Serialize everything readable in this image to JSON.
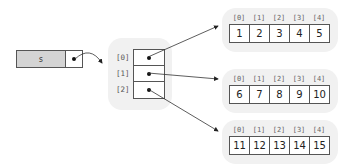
{
  "variable": {
    "name": "s"
  },
  "outer_array": {
    "indices": [
      "[0]",
      "[1]",
      "[2]"
    ]
  },
  "inner_arrays": [
    {
      "indices": [
        "[0]",
        "[1]",
        "[2]",
        "[3]",
        "[4]"
      ],
      "values": [
        "1",
        "2",
        "3",
        "4",
        "5"
      ]
    },
    {
      "indices": [
        "[0]",
        "[1]",
        "[2]",
        "[3]",
        "[4]"
      ],
      "values": [
        "6",
        "7",
        "8",
        "9",
        "10"
      ]
    },
    {
      "indices": [
        "[0]",
        "[1]",
        "[2]",
        "[3]",
        "[4]"
      ],
      "values": [
        "11",
        "12",
        "13",
        "14",
        "15"
      ]
    }
  ]
}
